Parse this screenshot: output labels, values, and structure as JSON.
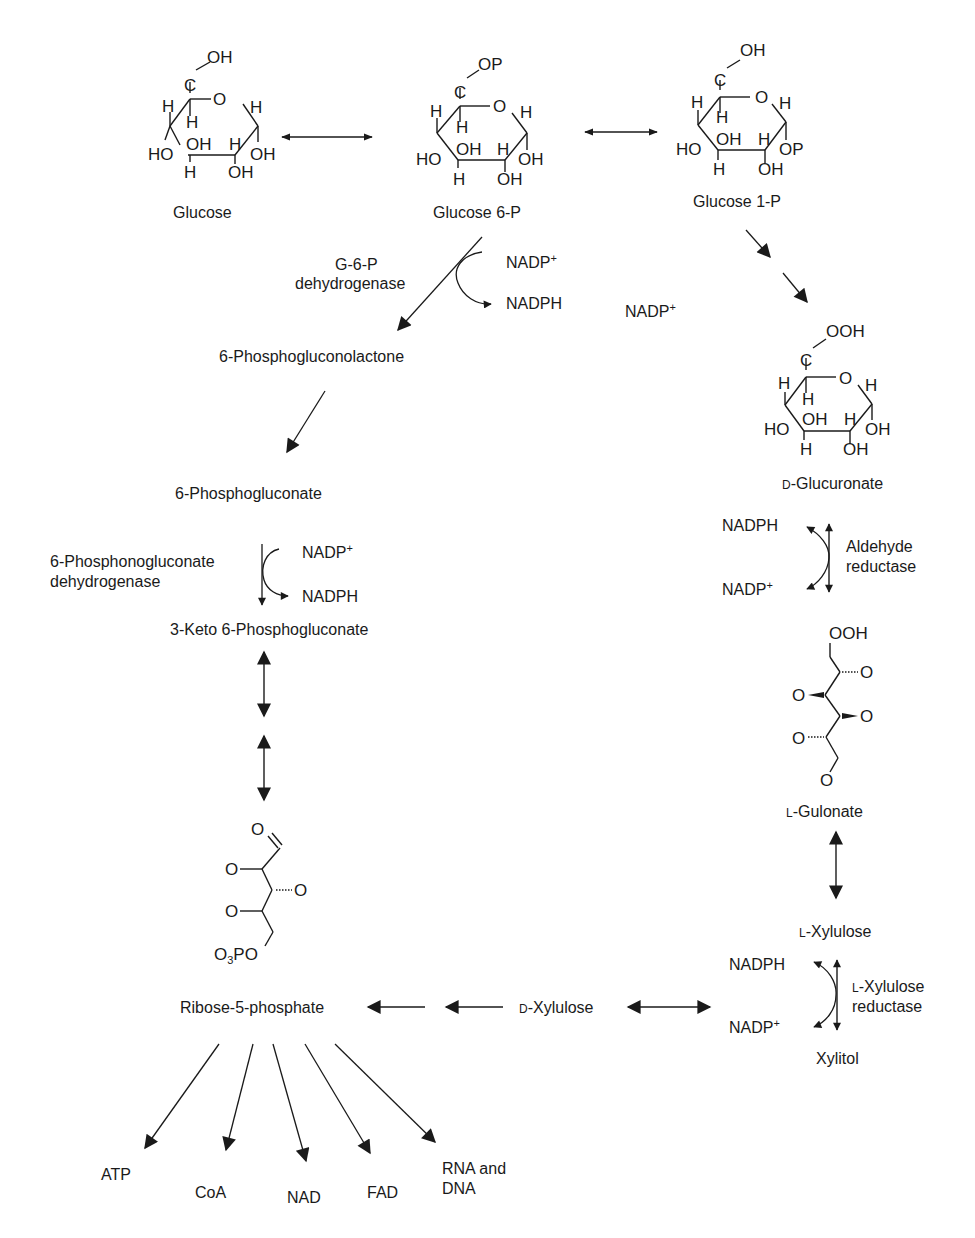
{
  "diagram": {
    "type": "metabolic-pathway",
    "nodes": {
      "glucose": {
        "label": "Glucose",
        "substituents": {
          "top": "OH",
          "c": "C",
          "ring_o": "O",
          "h_left": "H",
          "h_inner": "H",
          "h_right": "H",
          "ho_left": "HO",
          "oh_inner": "OH",
          "h_inner2": "H",
          "oh_right": "OH",
          "h_bottom": "H",
          "oh_bottom": "OH"
        }
      },
      "glucose6p": {
        "label": "Glucose 6-P",
        "substituents": {
          "top": "OP",
          "c": "C",
          "ring_o": "O",
          "h_left": "H",
          "h_inner": "H",
          "h_right": "H",
          "ho_left": "HO",
          "oh_inner": "OH",
          "h_inner2": "H",
          "oh_right": "OH",
          "h_bottom": "H",
          "oh_bottom": "OH"
        }
      },
      "glucose1p": {
        "label": "Glucose 1-P",
        "substituents": {
          "top": "OH",
          "c": "C",
          "ring_o": "O",
          "h_left": "H",
          "h_inner": "H",
          "h_right": "H",
          "ho_left": "HO",
          "oh_inner": "OH",
          "h_inner2": "H",
          "oh_right": "OP",
          "h_bottom": "H",
          "oh_bottom": "OH"
        }
      },
      "glucuronate": {
        "prefix": "D",
        "label": "-Glucuronate",
        "substituents": {
          "top": "OOH",
          "c": "C",
          "ring_o": "O",
          "h_left": "H",
          "h_inner": "H",
          "h_right": "H",
          "ho_left": "HO",
          "oh_inner": "OH",
          "h_inner2": "H",
          "oh_right": "OH",
          "h_bottom": "H",
          "oh_bottom": "OH"
        }
      },
      "phosphogluconolactone": {
        "label": "6-Phosphogluconolactone"
      },
      "phosphogluconate": {
        "label": "6-Phosphogluconate"
      },
      "keto_phosphogluconate": {
        "label": "3-Keto 6-Phosphogluconate"
      },
      "ribose5p": {
        "label": "Ribose-5-phosphate",
        "atoms": {
          "aldehyde_o": "O",
          "o1": "O",
          "o2": "O",
          "o3": "O",
          "o3po_main": "O",
          "o3po_sub": "3",
          "o3po_tail": "PO"
        }
      },
      "gulonate": {
        "prefix": "L",
        "label": "-Gulonate",
        "atoms": {
          "top": "OOH",
          "o1": "O",
          "o2": "O",
          "o3": "O",
          "o4": "O",
          "o5": "O"
        }
      },
      "l_xylulose": {
        "prefix": "L",
        "label": "-Xylulose"
      },
      "d_xylulose": {
        "prefix": "D",
        "label": "-Xylulose"
      },
      "xylitol": {
        "label": "Xylitol"
      }
    },
    "enzymes": {
      "g6pd": {
        "line1": "G-6-P",
        "line2": "dehydrogenase"
      },
      "pgd": {
        "line1": "6-Phosphonogluconate",
        "line2": "dehydrogenase"
      },
      "aldehyde_reductase": {
        "line1": "Aldehyde",
        "line2": "reductase"
      },
      "xylulose_reductase": {
        "prefix": "L",
        "line1": "-Xylulose",
        "line2": "reductase"
      }
    },
    "cofactors": {
      "nadp": "NADP",
      "nadp_sup": "+",
      "nadph": "NADPH"
    },
    "products": [
      {
        "label": "ATP"
      },
      {
        "label": "CoA"
      },
      {
        "label": "NAD"
      },
      {
        "label": "FAD"
      },
      {
        "label": "RNA and",
        "label2": "DNA"
      }
    ],
    "colors": {
      "ink": "#1a1a1a",
      "background": "#ffffff"
    }
  }
}
